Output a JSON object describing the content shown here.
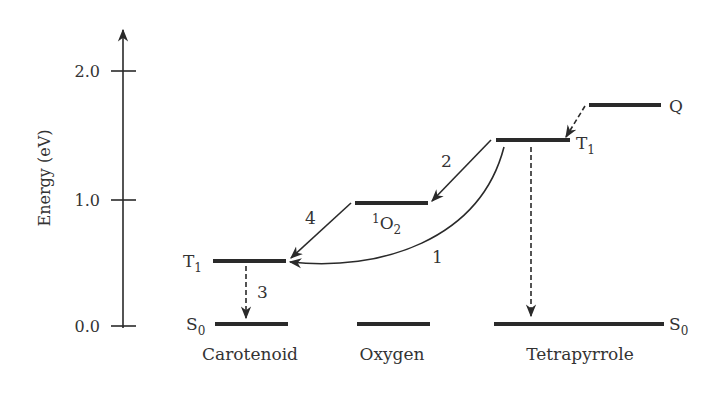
{
  "axis": {
    "label": "Energy (eV)",
    "ticks": [
      {
        "value": 0.0,
        "label": "0.0"
      },
      {
        "value": 1.0,
        "label": "1.0"
      },
      {
        "value": 2.0,
        "label": "2.0"
      }
    ],
    "range": [
      0,
      2.4
    ]
  },
  "molecules": [
    {
      "id": "carotenoid",
      "name": "Carotenoid"
    },
    {
      "id": "oxygen",
      "name": "Oxygen"
    },
    {
      "id": "tetrapyrrole",
      "name": "Tetrapyrrole"
    }
  ],
  "levels": {
    "carotenoid_s0": {
      "energy": 0.0,
      "label": "S",
      "sub": "0"
    },
    "carotenoid_t1": {
      "energy": 0.51,
      "label": "T",
      "sub": "1"
    },
    "oxygen_ground": {
      "energy": 0.0
    },
    "oxygen_singlet": {
      "energy": 0.97,
      "sup": "1",
      "label": "O",
      "sub": "2"
    },
    "tetrapyrrole_s0": {
      "energy": 0.0,
      "label": "S",
      "sub": "0"
    },
    "tetrapyrrole_t1": {
      "energy": 1.46,
      "label": "T",
      "sub": "1"
    },
    "quencher": {
      "energy": 1.74,
      "label": "Q"
    }
  },
  "transitions": [
    {
      "id": "1",
      "label": "1",
      "from": "tetrapyrrole_t1",
      "to": "carotenoid_t1",
      "style": "solid-curve"
    },
    {
      "id": "2",
      "label": "2",
      "from": "tetrapyrrole_t1",
      "to": "oxygen_singlet",
      "style": "solid"
    },
    {
      "id": "3",
      "label": "3",
      "from": "carotenoid_t1",
      "to": "carotenoid_s0",
      "style": "dashed"
    },
    {
      "id": "4",
      "label": "4",
      "from": "oxygen_singlet",
      "to": "carotenoid_t1",
      "style": "solid"
    },
    {
      "id": "q",
      "label": "",
      "from": "quencher",
      "to": "tetrapyrrole_t1",
      "style": "dashed"
    },
    {
      "id": "t",
      "label": "",
      "from": "tetrapyrrole_t1",
      "to": "tetrapyrrole_s0",
      "style": "dashed"
    }
  ]
}
